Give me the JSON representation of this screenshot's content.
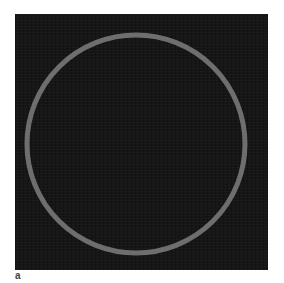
{
  "figure": {
    "panel_label": "a",
    "background_color": "#161616",
    "ring": {
      "color": "#6e6e6e",
      "center_x": 121,
      "center_y": 130,
      "radius": 109,
      "stroke_width": 5
    }
  }
}
